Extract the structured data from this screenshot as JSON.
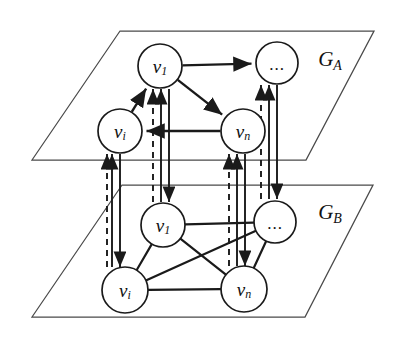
{
  "figure": {
    "background_color": "#ffffff",
    "ink_color": "#1a1a1a",
    "plane_color": "#4a4a4a"
  },
  "planes": [
    {
      "id": "GA",
      "label_main": "G",
      "label_sub": "A",
      "label_x": 330,
      "label_y": 59,
      "outline": "120,31 374,31 306,160 32,160",
      "graph_kind": "directed"
    },
    {
      "id": "GB",
      "label_main": "G",
      "label_sub": "B",
      "label_x": 330,
      "label_y": 212,
      "outline": "122,185 373,185 305,317 32,317",
      "graph_kind": "undirected"
    }
  ],
  "nodes": [
    {
      "id": "a-v1",
      "plane": "GA",
      "kind": "label",
      "main": "v",
      "sub": "1",
      "cx": 160,
      "cy": 66,
      "r": 22
    },
    {
      "id": "a-dots",
      "plane": "GA",
      "kind": "dots",
      "main": "...",
      "sub": "",
      "cx": 277,
      "cy": 63,
      "r": 21
    },
    {
      "id": "a-vi",
      "plane": "GA",
      "kind": "label",
      "main": "v",
      "sub": "i",
      "cx": 120,
      "cy": 131,
      "r": 22
    },
    {
      "id": "a-vn",
      "plane": "GA",
      "kind": "label",
      "main": "v",
      "sub": "n",
      "cx": 243,
      "cy": 131,
      "r": 22
    },
    {
      "id": "b-v1",
      "plane": "GB",
      "kind": "label",
      "main": "v",
      "sub": "1",
      "cx": 163,
      "cy": 225,
      "r": 22
    },
    {
      "id": "b-dots",
      "plane": "GB",
      "kind": "dots",
      "main": "...",
      "sub": "",
      "cx": 275,
      "cy": 222,
      "r": 21
    },
    {
      "id": "b-vi",
      "plane": "GB",
      "kind": "label",
      "main": "v",
      "sub": "i",
      "cx": 125,
      "cy": 290,
      "r": 23
    },
    {
      "id": "b-vn",
      "plane": "GB",
      "kind": "label",
      "main": "v",
      "sub": "n",
      "cx": 244,
      "cy": 289,
      "r": 23
    }
  ],
  "intra_edges": [
    {
      "id": "ea-v1-dots",
      "plane": "GA",
      "from": "a-v1",
      "to": "a-dots",
      "directed": true
    },
    {
      "id": "ea-v1-vn",
      "plane": "GA",
      "from": "a-v1",
      "to": "a-vn",
      "directed": true
    },
    {
      "id": "ea-vi-v1",
      "plane": "GA",
      "from": "a-vi",
      "to": "a-v1",
      "directed": true
    },
    {
      "id": "ea-vn-vi",
      "plane": "GA",
      "from": "a-vn",
      "to": "a-vi",
      "directed": true
    },
    {
      "id": "eb-v1-dots",
      "plane": "GB",
      "from": "b-v1",
      "to": "b-dots",
      "directed": false
    },
    {
      "id": "eb-v1-vi",
      "plane": "GB",
      "from": "b-v1",
      "to": "b-vi",
      "directed": false
    },
    {
      "id": "eb-v1-vn",
      "plane": "GB",
      "from": "b-v1",
      "to": "b-vn",
      "directed": false
    },
    {
      "id": "eb-vi-dots",
      "plane": "GB",
      "from": "b-vi",
      "to": "b-dots",
      "directed": false
    },
    {
      "id": "eb-vi-vn",
      "plane": "GB",
      "from": "b-vi",
      "to": "b-vn",
      "directed": false
    },
    {
      "id": "eb-vn-dots",
      "plane": "GB",
      "from": "b-vn",
      "to": "b-dots",
      "directed": false
    }
  ],
  "inter_links": [
    {
      "id": "link-vi",
      "pair": "v_i",
      "up_x": 112,
      "down_x": 120,
      "dashed_x": 107,
      "top_y": 154,
      "bottom_y": 267
    },
    {
      "id": "link-v1",
      "pair": "v_1",
      "up_x": 161,
      "down_x": 169,
      "dashed_x": 153,
      "top_y": 89,
      "bottom_y": 202
    },
    {
      "id": "link-vn",
      "pair": "v_n",
      "up_x": 237,
      "down_x": 245,
      "dashed_x": 229,
      "top_y": 154,
      "bottom_y": 266
    },
    {
      "id": "link-dots",
      "pair": "dots",
      "up_x": 269,
      "down_x": 277,
      "dashed_x": 261,
      "top_y": 85,
      "bottom_y": 199
    }
  ],
  "legend": {
    "solid_meaning": "intra-layer directed edge",
    "dashed_meaning": "inter-layer counterpart link"
  }
}
